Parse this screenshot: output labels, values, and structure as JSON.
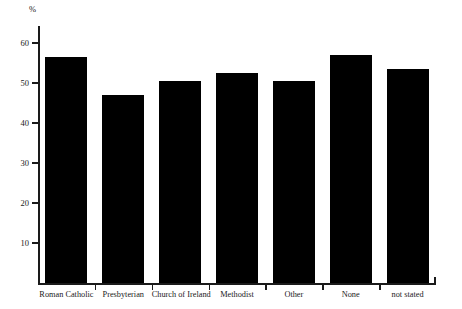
{
  "chart_data": {
    "type": "bar",
    "title": "",
    "subtitle": "",
    "xlabel": "",
    "ylabel": "%",
    "unit_label": "%",
    "categories": [
      "Roman Catholic",
      "Presbyterian",
      "Church of Ireland",
      "Methodist",
      "Other",
      "None",
      "not stated"
    ],
    "values": [
      56.5,
      47.0,
      50.5,
      52.5,
      50.5,
      57.0,
      53.5
    ],
    "ylim": [
      0,
      62
    ],
    "yticks": [
      10,
      20,
      30,
      40,
      50,
      60
    ],
    "ytick_labels": [
      "10",
      "20",
      "30",
      "40",
      "50",
      "60"
    ],
    "grid": false,
    "legend": false,
    "legend_position": "none",
    "bar_color": "#000000",
    "axis_color": "#1a1a1a",
    "background_color": "#ffffff"
  }
}
